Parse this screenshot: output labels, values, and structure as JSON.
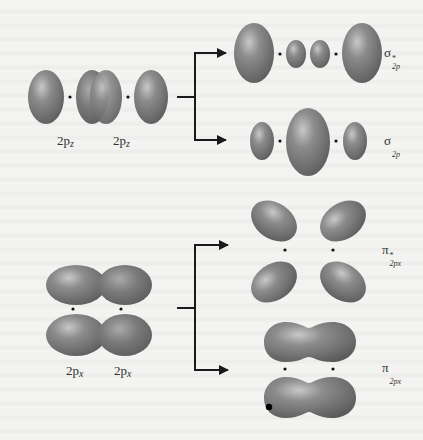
{
  "diagram": {
    "colors": {
      "lobe": "#6e6e6e",
      "lobe_highlight": "#c4c4c4",
      "lobe_edge": "#555555",
      "arrow": "#1a1a1a",
      "nucleus": "#111111",
      "background": "#f3f3f1"
    },
    "atomic_orbitals": {
      "pz": {
        "left_label": "2p",
        "left_sub": "z",
        "right_label": "2p",
        "right_sub": "z"
      },
      "px": {
        "left_label": "2p",
        "left_sub": "x",
        "right_label": "2p",
        "right_sub": "x"
      }
    },
    "molecular_orbitals": [
      {
        "id": "sigma-star-2p",
        "symbol": "σ",
        "sup": "*",
        "sub": "2p"
      },
      {
        "id": "sigma-2p",
        "symbol": "σ",
        "sup": "",
        "sub": "2p"
      },
      {
        "id": "pi-star-2px",
        "symbol": "π",
        "sup": "*",
        "sub": "2px"
      },
      {
        "id": "pi-2px",
        "symbol": "π",
        "sup": "",
        "sub": "2px"
      }
    ]
  }
}
